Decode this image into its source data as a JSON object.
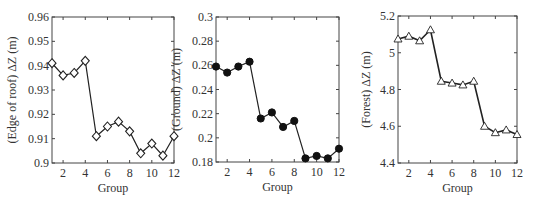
{
  "chart_data": [
    {
      "type": "line",
      "title": "",
      "xlabel": "Group",
      "ylabel": "(Edge of roof)  ΔZ (m)",
      "x": [
        1,
        2,
        3,
        4,
        5,
        6,
        7,
        8,
        9,
        10,
        11,
        12
      ],
      "values": [
        0.941,
        0.936,
        0.937,
        0.942,
        0.911,
        0.915,
        0.917,
        0.913,
        0.904,
        0.908,
        0.903,
        0.911
      ],
      "marker": "diamond-open",
      "xlim": [
        1,
        12
      ],
      "ylim": [
        0.9,
        0.96
      ],
      "xticks": [
        2,
        4,
        6,
        8,
        10,
        12
      ],
      "yticks": [
        0.9,
        0.91,
        0.92,
        0.93,
        0.94,
        0.95,
        0.96
      ],
      "ytick_labels": [
        "0.9",
        "0.91",
        "0.92",
        "0.93",
        "0.94",
        "0.95",
        "0.96"
      ],
      "grid": false,
      "box": {
        "left": 52,
        "right": 174,
        "top": 17,
        "bottom": 163
      }
    },
    {
      "type": "line",
      "title": "",
      "xlabel": "Group",
      "ylabel": "(Ground)  ΔZ (m)",
      "x": [
        1,
        2,
        3,
        4,
        5,
        6,
        7,
        8,
        9,
        10,
        11,
        12
      ],
      "values": [
        0.259,
        0.254,
        0.259,
        0.263,
        0.216,
        0.221,
        0.209,
        0.214,
        0.183,
        0.185,
        0.183,
        0.191
      ],
      "marker": "circle-filled",
      "xlim": [
        1,
        12
      ],
      "ylim": [
        0.18,
        0.3
      ],
      "xticks": [
        2,
        4,
        6,
        8,
        10,
        12
      ],
      "yticks": [
        0.18,
        0.2,
        0.22,
        0.24,
        0.26,
        0.28,
        0.3
      ],
      "ytick_labels": [
        "0.18",
        "0.2",
        "0.22",
        "0.24",
        "0.26",
        "0.28",
        "0.3"
      ],
      "grid": false,
      "box": {
        "left": 216,
        "right": 339,
        "top": 17,
        "bottom": 162
      }
    },
    {
      "type": "line",
      "title": "",
      "xlabel": "Group",
      "ylabel": "(Forest)  ΔZ (m)",
      "x": [
        1,
        2,
        3,
        4,
        5,
        6,
        7,
        8,
        9,
        10,
        11,
        12
      ],
      "values": [
        5.075,
        5.09,
        5.065,
        5.125,
        4.845,
        4.835,
        4.825,
        4.845,
        4.6,
        4.565,
        4.58,
        4.555
      ],
      "marker": "triangle-open",
      "xlim": [
        1,
        12
      ],
      "ylim": [
        4.4,
        5.2
      ],
      "xticks": [
        2,
        4,
        6,
        8,
        10,
        12
      ],
      "yticks": [
        4.4,
        4.6,
        4.8,
        5.0,
        5.2
      ],
      "ytick_labels": [
        "4.4",
        "4.6",
        "4.8",
        "5",
        "5.2"
      ],
      "grid": false,
      "box": {
        "left": 398,
        "right": 517,
        "top": 16,
        "bottom": 163
      }
    }
  ],
  "colors": {
    "line": "#222222",
    "axis": "#444444",
    "text": "#333333",
    "background": "#ffffff"
  }
}
